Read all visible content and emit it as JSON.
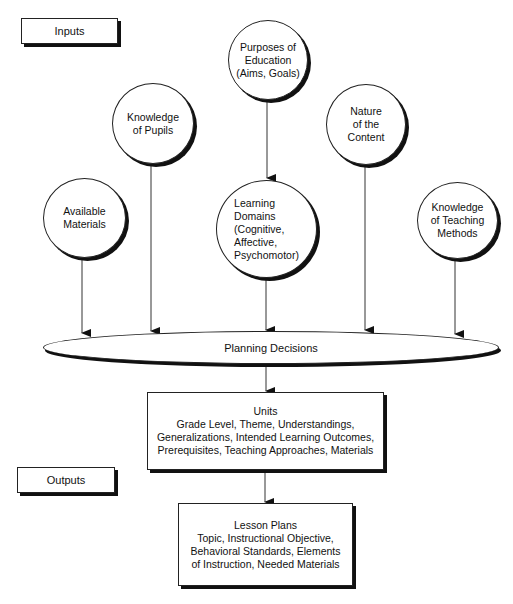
{
  "labels": {
    "inputs": "Inputs",
    "outputs": "Outputs"
  },
  "inputs": [
    {
      "id": "purposes",
      "text": "Purposes of\nEducation\n(Aims, Goals)"
    },
    {
      "id": "pupils",
      "text": "Knowledge\nof Pupils"
    },
    {
      "id": "nature",
      "text": "Nature\nof the\nContent"
    },
    {
      "id": "materials",
      "text": "Available\nMaterials"
    },
    {
      "id": "domains",
      "text": "Learning\nDomains\n(Cognitive,\nAffective,\nPsychomotor)"
    },
    {
      "id": "methods",
      "text": "Knowledge\nof Teaching\nMethods"
    }
  ],
  "planning": {
    "text": "Planning Decisions"
  },
  "units": {
    "title": "Units",
    "details": "Grade Level, Theme, Understandings,\nGeneralizations, Intended Learning Outcomes,\nPrerequisites, Teaching Approaches, Materials"
  },
  "lesson_plans": {
    "title": "Lesson Plans",
    "details": "Topic, Instructional Objective,\nBehavioral Standards, Elements\nof Instruction, Needed Materials"
  }
}
